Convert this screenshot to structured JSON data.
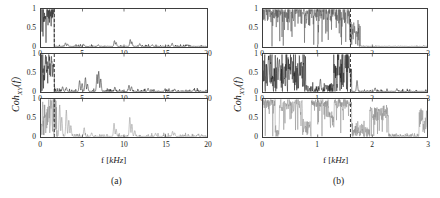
{
  "figure": {
    "ylabel_main": "Coh",
    "ylabel_sub": "XY",
    "ylabel_tail": "(f)",
    "xlabel_prefix": "f [",
    "xlabel_unit": "kHz",
    "xlabel_suffix": "]",
    "subcaption_a": "(a)",
    "subcaption_b": "(b)",
    "axis_color": "#3d3d3d",
    "trace_color_dark": "#1a1a1a",
    "trace_color_mid": "#555555",
    "trace_color_light": "#8a8a8a",
    "cutoff_line_color": "#222222"
  },
  "chart_data": [
    {
      "id": "a-top",
      "type": "line",
      "panel_group": "(a)",
      "row": 1,
      "title": "",
      "xlabel": "f [kHz]",
      "ylabel": "Coh_XY(f)",
      "xlim": [
        0,
        20
      ],
      "ylim": [
        0,
        1
      ],
      "xticks": [
        0,
        5,
        10,
        15,
        20
      ],
      "xticklabels": [
        "0",
        "5",
        "10",
        "15",
        "20"
      ],
      "yticks": [
        0,
        0.5,
        1
      ],
      "yticklabels": [
        "0",
        "0.5",
        "1"
      ],
      "grid": false,
      "legend": null,
      "cutoff_marker": {
        "x": 1.6,
        "style": "dashed",
        "label": ""
      },
      "series": [
        {
          "name": "coherence",
          "color": "#1a1a1a",
          "seed": 1171,
          "bands": [
            {
              "x0": 0.0,
              "x1": 1.62,
              "level": 0.93,
              "rough": 0.55,
              "dense": 1.0
            },
            {
              "x0": 1.62,
              "x1": 20.0,
              "level": 0.02,
              "rough": 0.06,
              "dense": 0.12
            }
          ],
          "spikes": [
            {
              "x": 2.95,
              "h": 0.1
            },
            {
              "x": 3.2,
              "h": 0.07
            },
            {
              "x": 5.15,
              "h": 0.06
            },
            {
              "x": 6.9,
              "h": 0.05
            },
            {
              "x": 8.85,
              "h": 0.16
            },
            {
              "x": 9.05,
              "h": 0.11
            },
            {
              "x": 10.75,
              "h": 0.19
            },
            {
              "x": 10.95,
              "h": 0.13
            },
            {
              "x": 11.9,
              "h": 0.08
            },
            {
              "x": 13.4,
              "h": 0.05
            },
            {
              "x": 15.8,
              "h": 0.09
            },
            {
              "x": 17.6,
              "h": 0.05
            }
          ]
        }
      ]
    },
    {
      "id": "a-mid",
      "type": "line",
      "panel_group": "(a)",
      "row": 2,
      "title": "",
      "xlabel": "f [kHz]",
      "ylabel": "Coh_XY(f)",
      "xlim": [
        0,
        20
      ],
      "ylim": [
        0,
        1
      ],
      "xticks": [
        0,
        5,
        10,
        15,
        20
      ],
      "xticklabels": [
        "0",
        "5",
        "10",
        "15",
        "20"
      ],
      "yticks": [
        0,
        0.5,
        1
      ],
      "yticklabels": [
        "0",
        "0.5",
        "1"
      ],
      "grid": false,
      "legend": null,
      "cutoff_marker": {
        "x": 1.6,
        "style": "dashed",
        "label": ""
      },
      "series": [
        {
          "name": "coherence",
          "color": "#1a1a1a",
          "seed": 2281,
          "bands": [
            {
              "x0": 0.0,
              "x1": 1.6,
              "level": 0.52,
              "rough": 0.85,
              "dense": 1.0
            },
            {
              "x0": 1.6,
              "x1": 20.0,
              "level": 0.03,
              "rough": 0.09,
              "dense": 0.2
            }
          ],
          "spikes": [
            {
              "x": 0.55,
              "h": 0.99
            },
            {
              "x": 0.95,
              "h": 0.82
            },
            {
              "x": 1.25,
              "h": 0.97
            },
            {
              "x": 1.45,
              "h": 0.72
            },
            {
              "x": 2.6,
              "h": 0.13
            },
            {
              "x": 3.05,
              "h": 0.11
            },
            {
              "x": 4.65,
              "h": 0.3
            },
            {
              "x": 4.95,
              "h": 0.22
            },
            {
              "x": 5.35,
              "h": 0.38
            },
            {
              "x": 5.6,
              "h": 0.2
            },
            {
              "x": 6.75,
              "h": 0.46
            },
            {
              "x": 6.95,
              "h": 0.55
            },
            {
              "x": 7.2,
              "h": 0.34
            },
            {
              "x": 8.9,
              "h": 0.12
            },
            {
              "x": 10.6,
              "h": 0.17
            },
            {
              "x": 10.9,
              "h": 0.13
            },
            {
              "x": 12.9,
              "h": 0.09
            },
            {
              "x": 14.95,
              "h": 0.08
            },
            {
              "x": 16.1,
              "h": 0.07
            },
            {
              "x": 18.4,
              "h": 0.06
            }
          ]
        }
      ]
    },
    {
      "id": "a-bot",
      "type": "line",
      "panel_group": "(a)",
      "row": 3,
      "title": "",
      "xlabel": "f [kHz]",
      "ylabel": "Coh_XY(f)",
      "xlim": [
        0,
        20
      ],
      "ylim": [
        0,
        1
      ],
      "xticks": [
        0,
        5,
        10,
        15,
        20
      ],
      "xticklabels": [
        "0",
        "5",
        "10",
        "15",
        "20"
      ],
      "yticks": [
        0,
        0.5,
        1
      ],
      "yticklabels": [
        "0",
        "0.5",
        "1"
      ],
      "grid": false,
      "legend": null,
      "cutoff_marker": {
        "x": 1.6,
        "style": "dashed",
        "label": ""
      },
      "series": [
        {
          "name": "coherence",
          "color": "#8a8a8a",
          "seed": 3391,
          "bands": [
            {
              "x0": 0.0,
              "x1": 1.95,
              "level": 0.62,
              "rough": 0.95,
              "dense": 1.0
            },
            {
              "x0": 1.95,
              "x1": 20.0,
              "level": 0.03,
              "rough": 0.08,
              "dense": 0.22
            }
          ],
          "spikes": [
            {
              "x": 2.25,
              "h": 0.86
            },
            {
              "x": 2.5,
              "h": 0.52
            },
            {
              "x": 3.05,
              "h": 0.72
            },
            {
              "x": 3.35,
              "h": 0.44
            },
            {
              "x": 3.6,
              "h": 0.3
            },
            {
              "x": 5.2,
              "h": 0.24
            },
            {
              "x": 6.1,
              "h": 0.1
            },
            {
              "x": 8.8,
              "h": 0.36
            },
            {
              "x": 9.05,
              "h": 0.2
            },
            {
              "x": 10.7,
              "h": 0.52
            },
            {
              "x": 10.95,
              "h": 0.34
            },
            {
              "x": 11.3,
              "h": 0.16
            },
            {
              "x": 13.8,
              "h": 0.09
            },
            {
              "x": 15.85,
              "h": 0.14
            },
            {
              "x": 16.1,
              "h": 0.1
            },
            {
              "x": 18.9,
              "h": 0.06
            }
          ]
        }
      ]
    },
    {
      "id": "b-top",
      "type": "line",
      "panel_group": "(b)",
      "row": 1,
      "title": "",
      "xlabel": "f [kHz]",
      "ylabel": "Coh_XY(f)",
      "xlim": [
        0,
        3
      ],
      "ylim": [
        0,
        1
      ],
      "xticks": [
        0,
        1,
        2,
        3
      ],
      "xticklabels": [
        "0",
        "1",
        "2",
        "3"
      ],
      "yticks": [
        0,
        0.5,
        1
      ],
      "yticklabels": [
        "0",
        "0.5",
        "1"
      ],
      "grid": false,
      "legend": null,
      "cutoff_marker": {
        "x": 1.6,
        "style": "dashed",
        "label": ""
      },
      "series": [
        {
          "name": "coherence",
          "color": "#555555",
          "seed": 4441,
          "bands": [
            {
              "x0": 0.0,
              "x1": 1.6,
              "level": 0.9,
              "rough": 0.5,
              "dense": 1.0
            },
            {
              "x0": 1.6,
              "x1": 1.78,
              "level": 0.35,
              "rough": 0.55,
              "dense": 1.0
            },
            {
              "x0": 1.78,
              "x1": 3.0,
              "level": 0.01,
              "rough": 0.04,
              "dense": 0.1
            }
          ],
          "spikes": []
        }
      ]
    },
    {
      "id": "b-mid",
      "type": "line",
      "panel_group": "(b)",
      "row": 2,
      "title": "",
      "xlabel": "f [kHz]",
      "ylabel": "Coh_XY(f)",
      "xlim": [
        0,
        3
      ],
      "ylim": [
        0,
        1
      ],
      "xticks": [
        0,
        1,
        2,
        3
      ],
      "xticklabels": [
        "0",
        "1",
        "2",
        "3"
      ],
      "yticks": [
        0,
        0.5,
        1
      ],
      "yticklabels": [
        "0",
        "0.5",
        "1"
      ],
      "grid": false,
      "legend": null,
      "cutoff_marker": {
        "x": 1.6,
        "style": "dashed",
        "label": ""
      },
      "series": [
        {
          "name": "coherence",
          "color": "#1a1a1a",
          "seed": 5551,
          "bands": [
            {
              "x0": 0.0,
              "x1": 0.78,
              "level": 0.58,
              "rough": 0.95,
              "dense": 1.0
            },
            {
              "x0": 0.78,
              "x1": 1.28,
              "level": 0.07,
              "rough": 0.22,
              "dense": 0.6
            },
            {
              "x0": 1.28,
              "x1": 1.62,
              "level": 0.5,
              "rough": 0.95,
              "dense": 1.0
            },
            {
              "x0": 1.62,
              "x1": 3.0,
              "level": 0.02,
              "rough": 0.07,
              "dense": 0.18
            }
          ],
          "spikes": [
            {
              "x": 0.1,
              "h": 0.96
            },
            {
              "x": 0.3,
              "h": 0.88
            },
            {
              "x": 0.52,
              "h": 0.93
            },
            {
              "x": 0.7,
              "h": 0.8
            },
            {
              "x": 1.05,
              "h": 0.34
            },
            {
              "x": 1.15,
              "h": 0.18
            },
            {
              "x": 1.38,
              "h": 0.9
            },
            {
              "x": 1.5,
              "h": 0.98
            },
            {
              "x": 1.58,
              "h": 0.62
            },
            {
              "x": 1.72,
              "h": 0.3
            },
            {
              "x": 2.05,
              "h": 0.1
            },
            {
              "x": 2.45,
              "h": 0.08
            }
          ]
        }
      ]
    },
    {
      "id": "b-bot",
      "type": "line",
      "panel_group": "(b)",
      "row": 3,
      "title": "",
      "xlabel": "f [kHz]",
      "ylabel": "Coh_XY(f)",
      "xlim": [
        0,
        3
      ],
      "ylim": [
        0,
        1
      ],
      "xticks": [
        0,
        1,
        2,
        3
      ],
      "xticklabels": [
        "0",
        "1",
        "2",
        "3"
      ],
      "yticks": [
        0,
        0.5,
        1
      ],
      "yticklabels": [
        "0",
        "0.5",
        "1"
      ],
      "grid": false,
      "legend": null,
      "cutoff_marker": {
        "x": 1.6,
        "style": "dashed",
        "label": ""
      },
      "series": [
        {
          "name": "coherence",
          "color": "#8a8a8a",
          "seed": 6661,
          "bands": [
            {
              "x0": 0.0,
              "x1": 0.22,
              "level": 0.9,
              "rough": 0.3,
              "dense": 1.0
            },
            {
              "x0": 0.22,
              "x1": 0.3,
              "level": 0.1,
              "rough": 0.25,
              "dense": 1.0
            },
            {
              "x0": 0.3,
              "x1": 0.72,
              "level": 0.86,
              "rough": 0.3,
              "dense": 1.0
            },
            {
              "x0": 0.72,
              "x1": 0.88,
              "level": 0.22,
              "rough": 0.35,
              "dense": 1.0
            },
            {
              "x0": 0.88,
              "x1": 1.2,
              "level": 0.88,
              "rough": 0.28,
              "dense": 1.0
            },
            {
              "x0": 1.2,
              "x1": 1.3,
              "level": 0.45,
              "rough": 0.45,
              "dense": 1.0
            },
            {
              "x0": 1.3,
              "x1": 1.62,
              "level": 0.9,
              "rough": 0.25,
              "dense": 1.0
            },
            {
              "x0": 1.62,
              "x1": 1.95,
              "level": 0.14,
              "rough": 0.35,
              "dense": 1.0
            },
            {
              "x0": 1.95,
              "x1": 2.3,
              "level": 0.62,
              "rough": 0.4,
              "dense": 1.0
            },
            {
              "x0": 2.3,
              "x1": 2.85,
              "level": 0.03,
              "rough": 0.09,
              "dense": 0.35
            },
            {
              "x0": 2.85,
              "x1": 3.0,
              "level": 0.4,
              "rough": 0.55,
              "dense": 1.0
            }
          ],
          "spikes": []
        }
      ]
    }
  ]
}
